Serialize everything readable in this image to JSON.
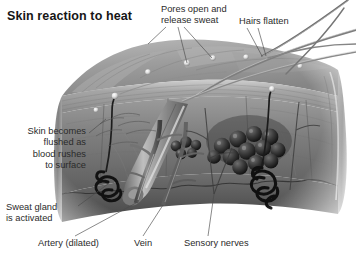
{
  "figure": {
    "title": "Skin reaction to heat",
    "style": "grayscale airbrushed medical illustration on white background"
  },
  "labels": [
    {
      "id": "pores",
      "name": "pores-open-release-sweat",
      "text": "Pores open and\nrelease sweat",
      "align": "left",
      "x": 161,
      "y": 4,
      "width": 84,
      "leaders": [
        {
          "x1": 166,
          "y1": 27,
          "x2": 148,
          "y2": 44
        },
        {
          "x1": 178,
          "y1": 27,
          "x2": 187,
          "y2": 63
        },
        {
          "x1": 184,
          "y1": 27,
          "x2": 212,
          "y2": 58
        }
      ]
    },
    {
      "id": "hairs",
      "name": "hairs-flatten",
      "text": "Hairs flatten",
      "align": "left",
      "x": 239,
      "y": 16,
      "width": 64,
      "leaders": [
        {
          "x1": 247,
          "y1": 28,
          "x2": 262,
          "y2": 56
        },
        {
          "x1": 258,
          "y1": 28,
          "x2": 266,
          "y2": 56
        }
      ]
    },
    {
      "id": "flushed",
      "name": "skin-becomes-flushed",
      "text": "Skin becomes\nflushed as\nblood rushes\nto surface",
      "align": "right",
      "x": 2,
      "y": 126,
      "width": 84,
      "leaders": [
        {
          "x1": 89,
          "y1": 133,
          "x2": 106,
          "y2": 119
        }
      ]
    },
    {
      "id": "sweatgland",
      "name": "sweat-gland-activated",
      "text": "Sweat gland\nis activated",
      "align": "left",
      "x": 6,
      "y": 202,
      "width": 72,
      "leaders": [
        {
          "x1": 78,
          "y1": 206,
          "x2": 108,
          "y2": 184
        }
      ]
    },
    {
      "id": "artery",
      "name": "artery-dilated",
      "text": "Artery (dilated)",
      "align": "left",
      "x": 38,
      "y": 238,
      "width": 78,
      "leaders": [
        {
          "x1": 75,
          "y1": 236,
          "x2": 136,
          "y2": 203
        }
      ]
    },
    {
      "id": "vein",
      "name": "vein",
      "text": "Vein",
      "align": "left",
      "x": 134,
      "y": 238,
      "width": 30,
      "leaders": [
        {
          "x1": 143,
          "y1": 236,
          "x2": 163,
          "y2": 205
        }
      ]
    },
    {
      "id": "nerves",
      "name": "sensory-nerves",
      "text": "Sensory nerves",
      "align": "left",
      "x": 184,
      "y": 238,
      "width": 80,
      "leaders": [
        {
          "x1": 208,
          "y1": 236,
          "x2": 214,
          "y2": 194
        }
      ]
    }
  ],
  "anatomy": {
    "structures": [
      "epidermis",
      "dermis",
      "subcutaneous fat",
      "hair shaft",
      "hair follicle",
      "sebaceous gland",
      "eccrine sweat gland",
      "sweat duct and pore",
      "dilated artery",
      "vein",
      "sensory nerve fibers"
    ]
  },
  "palette": {
    "background": "#ffffff",
    "title": "#161616",
    "label_text": "#2b2b2b",
    "leader_line": "#4a4a4a",
    "skin_light": "#c9c9c9",
    "skin_mid": "#9a9a9a",
    "skin_dark": "#6a6a6a",
    "skin_deep": "#3c3c3c",
    "gland_dark": "#171717",
    "hair": "#7f7f7f",
    "droplet": "#e8e8e8"
  }
}
